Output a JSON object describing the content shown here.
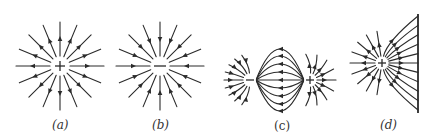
{
  "figure": {
    "panels": [
      {
        "id": "a",
        "label": "(a)",
        "description": "Field lines of a positive point charge",
        "charge_symbol": "+",
        "arrow_direction": "outward",
        "ray_count": 16
      },
      {
        "id": "b",
        "label": "(b)",
        "description": "Field lines of a negative point charge",
        "charge_symbol": "−",
        "arrow_direction": "inward",
        "ray_count": 16
      },
      {
        "id": "c",
        "label": "(c)",
        "description": "Field lines of an electric dipole",
        "charges": [
          {
            "symbol": "−"
          },
          {
            "symbol": "+"
          }
        ],
        "arrow_direction": "from + to −"
      },
      {
        "id": "d",
        "label": "(d)",
        "description": "Positive charge near a conducting plane",
        "charge_symbol": "+",
        "arrow_direction": "outward to plane"
      }
    ],
    "colors": {
      "ink": "#2a2a2a",
      "background": "#ffffff"
    }
  }
}
